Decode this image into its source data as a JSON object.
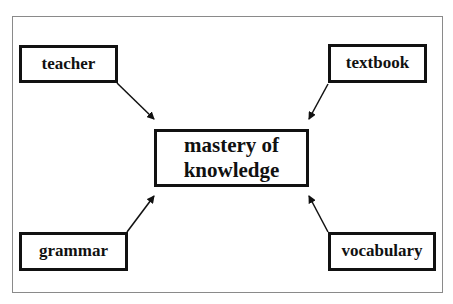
{
  "diagram": {
    "center": {
      "line1": "mastery of",
      "line2": "knowledge"
    },
    "nodes": {
      "teacher": "teacher",
      "textbook": "textbook",
      "grammar": "grammar",
      "vocabulary": "vocabulary"
    },
    "edges": [
      {
        "from": "teacher",
        "to": "mastery of knowledge"
      },
      {
        "from": "textbook",
        "to": "mastery of knowledge"
      },
      {
        "from": "grammar",
        "to": "mastery of knowledge"
      },
      {
        "from": "vocabulary",
        "to": "mastery of knowledge"
      }
    ]
  }
}
